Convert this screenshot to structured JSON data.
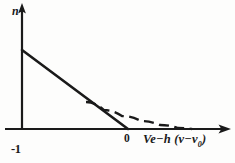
{
  "figure": {
    "background_color": "#fdfdfc",
    "ink_color": "#1a1a1a",
    "width": 235,
    "height": 163
  },
  "labels": {
    "y_axis": "n",
    "y_tick_minus_one": "-1",
    "x_tick_zero": "0",
    "x_axis_main": "Ve−h (ν−ν",
    "x_axis_subscript": "0",
    "x_axis_closing": ")"
  },
  "chart_data": {
    "type": "line",
    "title": "",
    "xlabel": "Ve−h (ν−ν0)",
    "ylabel": "n",
    "grid": false,
    "legend": null,
    "axes": {
      "x_axis_y_pixel": 129,
      "y_axis_x_pixel": 22,
      "x_origin_tick_pixel": 128,
      "x_arrow_tip_pixel": 230,
      "y_arrow_tip_pixel": 4,
      "y_tick_labels": [
        "-1"
      ],
      "x_tick_labels": [
        "0"
      ]
    },
    "series": [
      {
        "name": "solid-line",
        "style": "solid",
        "description": "Straight descending line from the n-axis intercept down to zero on the horizontal axis",
        "points": [
          [
            22,
            50
          ],
          [
            128,
            129
          ]
        ]
      },
      {
        "name": "dashed-curve",
        "style": "dashed",
        "description": "Dashed curve branching off the solid line and decaying asymptotically toward the horizontal axis",
        "points": [
          [
            86,
            102
          ],
          [
            104,
            110
          ],
          [
            122,
            116
          ],
          [
            141,
            121
          ],
          [
            160,
            125
          ],
          [
            178,
            128
          ],
          [
            192,
            129
          ]
        ]
      }
    ]
  }
}
